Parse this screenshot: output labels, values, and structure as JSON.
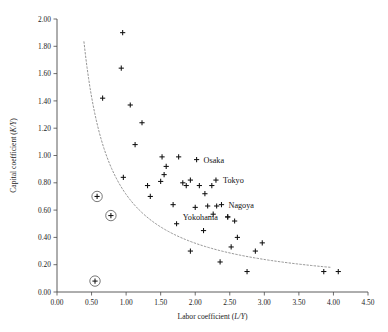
{
  "chart_data": {
    "type": "scatter",
    "title": "",
    "xlabel": "Labor coefficient (L/Y)",
    "xlabel_main": "Labor coefficient (",
    "xlabel_italic": "L/Y",
    "xlabel_close": ")",
    "ylabel": "Capital coefficient (K/Y)",
    "ylabel_main": "Capital coefficient (",
    "ylabel_italic": "K/Y",
    "ylabel_close": ")",
    "xlim": [
      0.0,
      4.5
    ],
    "ylim": [
      0.0,
      2.0
    ],
    "xticks": [
      "0.00",
      "0.50",
      "1.00",
      "1.50",
      "2.00",
      "2.50",
      "3.00",
      "3.50",
      "4.00",
      "4.50"
    ],
    "xtick_values": [
      0.0,
      0.5,
      1.0,
      1.5,
      2.0,
      2.5,
      3.0,
      3.5,
      4.0,
      4.5
    ],
    "yticks": [
      "0.00",
      "0.20",
      "0.40",
      "0.60",
      "0.80",
      "1.00",
      "1.20",
      "1.40",
      "1.60",
      "1.80",
      "2.00"
    ],
    "ytick_values": [
      0.0,
      0.2,
      0.4,
      0.6,
      0.8,
      1.0,
      1.2,
      1.4,
      1.6,
      1.8,
      2.0
    ],
    "grid": false,
    "legend": "none",
    "marker_symbol": "plus",
    "marker_color": "#111111",
    "points": [
      {
        "x": 0.95,
        "y": 1.9
      },
      {
        "x": 0.93,
        "y": 1.64
      },
      {
        "x": 0.66,
        "y": 1.42
      },
      {
        "x": 1.06,
        "y": 1.37
      },
      {
        "x": 1.23,
        "y": 1.24
      },
      {
        "x": 1.13,
        "y": 1.08
      },
      {
        "x": 0.96,
        "y": 0.84
      },
      {
        "x": 1.52,
        "y": 0.99
      },
      {
        "x": 1.58,
        "y": 0.92
      },
      {
        "x": 1.55,
        "y": 0.86
      },
      {
        "x": 1.5,
        "y": 0.81
      },
      {
        "x": 1.76,
        "y": 0.99
      },
      {
        "x": 1.82,
        "y": 0.8
      },
      {
        "x": 1.87,
        "y": 0.78
      },
      {
        "x": 1.93,
        "y": 0.82
      },
      {
        "x": 2.06,
        "y": 0.78
      },
      {
        "x": 2.24,
        "y": 0.78
      },
      {
        "x": 2.14,
        "y": 0.72
      },
      {
        "x": 1.31,
        "y": 0.78
      },
      {
        "x": 1.35,
        "y": 0.7
      },
      {
        "x": 1.68,
        "y": 0.64
      },
      {
        "x": 2.0,
        "y": 0.62
      },
      {
        "x": 2.18,
        "y": 0.63
      },
      {
        "x": 2.31,
        "y": 0.63
      },
      {
        "x": 2.26,
        "y": 0.57
      },
      {
        "x": 2.47,
        "y": 0.55
      },
      {
        "x": 1.73,
        "y": 0.5
      },
      {
        "x": 2.12,
        "y": 0.45
      },
      {
        "x": 2.57,
        "y": 0.52
      },
      {
        "x": 2.61,
        "y": 0.4
      },
      {
        "x": 2.52,
        "y": 0.33
      },
      {
        "x": 2.97,
        "y": 0.36
      },
      {
        "x": 2.87,
        "y": 0.3
      },
      {
        "x": 1.93,
        "y": 0.3
      },
      {
        "x": 2.36,
        "y": 0.22
      },
      {
        "x": 2.75,
        "y": 0.15
      },
      {
        "x": 3.86,
        "y": 0.15
      },
      {
        "x": 4.07,
        "y": 0.15
      }
    ],
    "highlighted_points": [
      {
        "x": 0.58,
        "y": 0.7,
        "ring": true
      },
      {
        "x": 0.78,
        "y": 0.56,
        "ring": true
      },
      {
        "x": 0.55,
        "y": 0.08,
        "ring": true
      }
    ],
    "labeled_points": [
      {
        "label": "Osaka",
        "x": 2.02,
        "y": 0.97,
        "label_dx": 7,
        "label_dy": 3
      },
      {
        "label": "Tokyo",
        "x": 2.3,
        "y": 0.82,
        "label_dx": 7,
        "label_dy": 3
      },
      {
        "label": "Nagoya",
        "x": 2.38,
        "y": 0.64,
        "label_dx": 7,
        "label_dy": 3
      },
      {
        "label": "Yokohama",
        "x": 2.47,
        "y": 0.55,
        "label_dx": -45,
        "label_dy": 3
      }
    ],
    "trend_curve": {
      "style": "dotted",
      "color": "#8a8a8a",
      "description": "hyperbolic fit",
      "constant": 0.715,
      "x_start": 0.39,
      "x_end": 3.95
    }
  }
}
